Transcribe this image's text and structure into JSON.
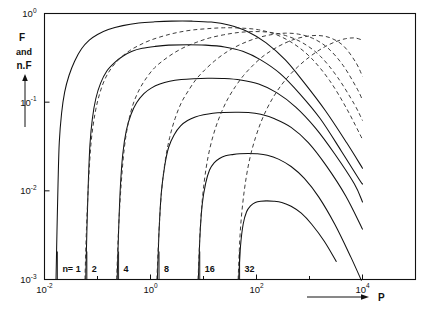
{
  "chart_data": {
    "type": "line",
    "title": "",
    "xlabel": "P",
    "ylabel": "F and n.F",
    "xscale": "log",
    "yscale": "log",
    "xlim": [
      0.01,
      100000.0
    ],
    "ylim": [
      0.001,
      1.0
    ],
    "grid": false,
    "legend": "none",
    "x_tick_labels": [
      "10",
      "10",
      "10",
      "10"
    ],
    "x_tick_exponents": [
      "-2",
      "0",
      "2",
      "4"
    ],
    "x_tick_values": [
      0.01,
      1.0,
      100.0,
      10000.0
    ],
    "x_minor_tick_values": [
      0.1,
      10.0,
      1000.0
    ],
    "y_tick_labels": [
      "10",
      "10",
      "10",
      "10"
    ],
    "y_tick_exponents": [
      "0",
      "-1",
      "-2",
      "-3"
    ],
    "y_tick_values": [
      1.0,
      0.1,
      0.01,
      0.001
    ],
    "n_prefix_label": "n=",
    "n_labels": [
      "1",
      "2",
      "4",
      "8",
      "16",
      "32"
    ],
    "n_values": [
      1,
      2,
      4,
      8,
      16,
      32
    ],
    "n_onset_P": [
      0.0175,
      0.063,
      0.25,
      1.45,
      8.5,
      48.0
    ],
    "series": [
      {
        "name": "n=1",
        "style": "solid",
        "peak_P": 8.0,
        "peak_F": 0.82,
        "onset_P": 0.0175,
        "points": [
          [
            0.0165,
            0.001
          ],
          [
            0.0172,
            0.0035
          ],
          [
            0.018,
            0.012
          ],
          [
            0.019,
            0.035
          ],
          [
            0.021,
            0.075
          ],
          [
            0.024,
            0.13
          ],
          [
            0.029,
            0.2
          ],
          [
            0.037,
            0.29
          ],
          [
            0.05,
            0.4
          ],
          [
            0.07,
            0.5
          ],
          [
            0.1,
            0.58
          ],
          [
            0.16,
            0.66
          ],
          [
            0.3,
            0.73
          ],
          [
            0.6,
            0.78
          ],
          [
            1.2,
            0.805
          ],
          [
            2.5,
            0.82
          ],
          [
            6.0,
            0.82
          ],
          [
            14.0,
            0.8
          ],
          [
            30.0,
            0.74
          ],
          [
            70.0,
            0.62
          ],
          [
            150.0,
            0.47
          ],
          [
            350.0,
            0.3
          ],
          [
            800.0,
            0.165
          ],
          [
            2000.0,
            0.08
          ],
          [
            5000.0,
            0.035
          ],
          [
            10000.0,
            0.018
          ]
        ]
      },
      {
        "name": "n=2",
        "style": "solid",
        "peak_P": 20.0,
        "peak_F": 0.44,
        "onset_P": 0.063,
        "points": [
          [
            0.06,
            0.001
          ],
          [
            0.063,
            0.0035
          ],
          [
            0.067,
            0.012
          ],
          [
            0.072,
            0.033
          ],
          [
            0.08,
            0.065
          ],
          [
            0.093,
            0.11
          ],
          [
            0.115,
            0.165
          ],
          [
            0.15,
            0.225
          ],
          [
            0.21,
            0.28
          ],
          [
            0.3,
            0.33
          ],
          [
            0.45,
            0.375
          ],
          [
            0.7,
            0.405
          ],
          [
            1.2,
            0.425
          ],
          [
            2.2,
            0.44
          ],
          [
            5.0,
            0.445
          ],
          [
            11.0,
            0.44
          ],
          [
            25.0,
            0.42
          ],
          [
            55.0,
            0.375
          ],
          [
            120.0,
            0.3
          ],
          [
            280.0,
            0.21
          ],
          [
            650.0,
            0.125
          ],
          [
            1600.0,
            0.065
          ],
          [
            4000.0,
            0.028
          ],
          [
            9000.0,
            0.013
          ],
          [
            10000.0,
            0.012
          ]
        ]
      },
      {
        "name": "n=4",
        "style": "solid",
        "peak_P": 40.0,
        "peak_F": 0.185,
        "onset_P": 0.25,
        "points": [
          [
            0.235,
            0.001
          ],
          [
            0.25,
            0.0035
          ],
          [
            0.27,
            0.011
          ],
          [
            0.3,
            0.026
          ],
          [
            0.35,
            0.048
          ],
          [
            0.43,
            0.073
          ],
          [
            0.55,
            0.099
          ],
          [
            0.75,
            0.125
          ],
          [
            1.05,
            0.145
          ],
          [
            1.5,
            0.16
          ],
          [
            2.3,
            0.172
          ],
          [
            3.8,
            0.18
          ],
          [
            6.5,
            0.184
          ],
          [
            12.0,
            0.186
          ],
          [
            25.0,
            0.185
          ],
          [
            50.0,
            0.178
          ],
          [
            110.0,
            0.16
          ],
          [
            240.0,
            0.128
          ],
          [
            550.0,
            0.088
          ],
          [
            1300.0,
            0.051
          ],
          [
            3000.0,
            0.026
          ],
          [
            7000.0,
            0.012
          ],
          [
            10000.0,
            0.0075
          ]
        ]
      },
      {
        "name": "n=8",
        "style": "solid",
        "peak_P": 75.0,
        "peak_F": 0.077,
        "onset_P": 1.45,
        "points": [
          [
            1.35,
            0.001
          ],
          [
            1.45,
            0.0035
          ],
          [
            1.6,
            0.0095
          ],
          [
            1.85,
            0.019
          ],
          [
            2.2,
            0.031
          ],
          [
            2.8,
            0.043
          ],
          [
            3.7,
            0.054
          ],
          [
            5.0,
            0.062
          ],
          [
            7.0,
            0.068
          ],
          [
            10.0,
            0.072
          ],
          [
            15.0,
            0.075
          ],
          [
            24.0,
            0.0765
          ],
          [
            40.0,
            0.077
          ],
          [
            70.0,
            0.0765
          ],
          [
            120.0,
            0.073
          ],
          [
            220.0,
            0.065
          ],
          [
            450.0,
            0.052
          ],
          [
            950.0,
            0.035
          ],
          [
            2100.0,
            0.019
          ],
          [
            4800.0,
            0.0088
          ],
          [
            10000.0,
            0.0037
          ]
        ]
      },
      {
        "name": "n=16",
        "style": "solid",
        "peak_P": 140.0,
        "peak_F": 0.026,
        "onset_P": 8.5,
        "points": [
          [
            8.0,
            0.001
          ],
          [
            8.6,
            0.0032
          ],
          [
            9.5,
            0.0072
          ],
          [
            11.0,
            0.0122
          ],
          [
            13.0,
            0.0172
          ],
          [
            16.0,
            0.0208
          ],
          [
            20.0,
            0.0232
          ],
          [
            26.0,
            0.0248
          ],
          [
            35.0,
            0.0256
          ],
          [
            48.0,
            0.0262
          ],
          [
            70.0,
            0.0264
          ],
          [
            100.0,
            0.0262
          ],
          [
            160.0,
            0.0252
          ],
          [
            260.0,
            0.0228
          ],
          [
            450.0,
            0.0188
          ],
          [
            800.0,
            0.0138
          ],
          [
            1500.0,
            0.0085
          ],
          [
            3000.0,
            0.0042
          ],
          [
            6000.0,
            0.0018
          ],
          [
            9500.0,
            0.00098
          ]
        ]
      },
      {
        "name": "n=32",
        "style": "solid",
        "peak_P": 280.0,
        "peak_F": 0.0077,
        "onset_P": 48.0,
        "points": [
          [
            46.0,
            0.001
          ],
          [
            50.0,
            0.0024
          ],
          [
            56.0,
            0.0042
          ],
          [
            65.0,
            0.0058
          ],
          [
            78.0,
            0.0068
          ],
          [
            95.0,
            0.0074
          ],
          [
            120.0,
            0.00765
          ],
          [
            155.0,
            0.0077
          ],
          [
            210.0,
            0.00765
          ],
          [
            300.0,
            0.0074
          ],
          [
            450.0,
            0.0067
          ],
          [
            700.0,
            0.0056
          ],
          [
            1100.0,
            0.0042
          ],
          [
            1900.0,
            0.0027
          ],
          [
            3200.0,
            0.0016
          ],
          [
            5200.0,
            0.00088
          ],
          [
            7000.0,
            0.00057
          ]
        ]
      },
      {
        "name": "nF-1",
        "style": "dashed",
        "peak_P": 30.0,
        "peak_F": 0.69,
        "onset_P": 0.062,
        "points": [
          [
            0.058,
            0.001
          ],
          [
            0.062,
            0.0038
          ],
          [
            0.068,
            0.013
          ],
          [
            0.076,
            0.036
          ],
          [
            0.09,
            0.075
          ],
          [
            0.11,
            0.125
          ],
          [
            0.14,
            0.185
          ],
          [
            0.19,
            0.25
          ],
          [
            0.27,
            0.315
          ],
          [
            0.4,
            0.38
          ],
          [
            0.62,
            0.44
          ],
          [
            1.0,
            0.5
          ],
          [
            1.8,
            0.56
          ],
          [
            3.2,
            0.61
          ],
          [
            6.0,
            0.65
          ],
          [
            12.0,
            0.675
          ],
          [
            24.0,
            0.69
          ],
          [
            50.0,
            0.685
          ],
          [
            110.0,
            0.655
          ],
          [
            240.0,
            0.575
          ],
          [
            520.0,
            0.45
          ],
          [
            1100.0,
            0.31
          ],
          [
            2400.0,
            0.175
          ],
          [
            5000.0,
            0.085
          ],
          [
            10000.0,
            0.038
          ]
        ]
      },
      {
        "name": "nF-2",
        "style": "dashed",
        "peak_P": 55.0,
        "peak_F": 0.625,
        "onset_P": 0.245,
        "points": [
          [
            0.23,
            0.001
          ],
          [
            0.25,
            0.0038
          ],
          [
            0.28,
            0.012
          ],
          [
            0.32,
            0.03
          ],
          [
            0.38,
            0.058
          ],
          [
            0.47,
            0.095
          ],
          [
            0.62,
            0.14
          ],
          [
            0.85,
            0.19
          ],
          [
            1.2,
            0.245
          ],
          [
            1.8,
            0.3
          ],
          [
            2.8,
            0.36
          ],
          [
            4.5,
            0.42
          ],
          [
            7.5,
            0.475
          ],
          [
            13.0,
            0.53
          ],
          [
            24.0,
            0.575
          ],
          [
            45.0,
            0.61
          ],
          [
            85.0,
            0.625
          ],
          [
            170.0,
            0.615
          ],
          [
            350.0,
            0.565
          ],
          [
            750.0,
            0.465
          ],
          [
            1600.0,
            0.33
          ],
          [
            3400.0,
            0.19
          ],
          [
            7000.0,
            0.095
          ],
          [
            10000.0,
            0.062
          ]
        ]
      },
      {
        "name": "nF-3",
        "style": "dashed",
        "peak_P": 110.0,
        "peak_F": 0.6,
        "onset_P": 1.42,
        "points": [
          [
            1.32,
            0.001
          ],
          [
            1.45,
            0.0036
          ],
          [
            1.62,
            0.01
          ],
          [
            1.9,
            0.022
          ],
          [
            2.3,
            0.04
          ],
          [
            2.9,
            0.065
          ],
          [
            3.8,
            0.098
          ],
          [
            5.2,
            0.135
          ],
          [
            7.2,
            0.18
          ],
          [
            10.5,
            0.23
          ],
          [
            16.0,
            0.29
          ],
          [
            25.0,
            0.355
          ],
          [
            40.0,
            0.42
          ],
          [
            68.0,
            0.485
          ],
          [
            115.0,
            0.54
          ],
          [
            200.0,
            0.58
          ],
          [
            350.0,
            0.6
          ],
          [
            620.0,
            0.585
          ],
          [
            1150.0,
            0.525
          ],
          [
            2200.0,
            0.41
          ],
          [
            4300.0,
            0.26
          ],
          [
            8000.0,
            0.14
          ],
          [
            10000.0,
            0.105
          ]
        ]
      },
      {
        "name": "nF-4",
        "style": "dashed",
        "peak_P": 220.0,
        "peak_F": 0.57,
        "onset_P": 8.4,
        "points": [
          [
            7.9,
            0.001
          ],
          [
            8.6,
            0.0034
          ],
          [
            9.6,
            0.0085
          ],
          [
            11.2,
            0.018
          ],
          [
            13.5,
            0.032
          ],
          [
            17.0,
            0.052
          ],
          [
            22.0,
            0.078
          ],
          [
            29.0,
            0.11
          ],
          [
            40.0,
            0.15
          ],
          [
            57.0,
            0.2
          ],
          [
            83.0,
            0.255
          ],
          [
            125.0,
            0.32
          ],
          [
            195.0,
            0.385
          ],
          [
            310.0,
            0.45
          ],
          [
            510.0,
            0.51
          ],
          [
            850.0,
            0.55
          ],
          [
            1450.0,
            0.565
          ],
          [
            2500.0,
            0.53
          ],
          [
            4400.0,
            0.43
          ],
          [
            7500.0,
            0.28
          ],
          [
            10000.0,
            0.195
          ]
        ]
      },
      {
        "name": "nF-5",
        "style": "dashed",
        "peak_P": 420.0,
        "peak_F": 0.54,
        "onset_P": 47.0,
        "points": [
          [
            45.0,
            0.001
          ],
          [
            49.0,
            0.0032
          ],
          [
            55.0,
            0.0072
          ],
          [
            64.0,
            0.0142
          ],
          [
            77.0,
            0.025
          ],
          [
            96.0,
            0.04
          ],
          [
            122.0,
            0.06
          ],
          [
            160.0,
            0.086
          ],
          [
            215.0,
            0.118
          ],
          [
            295.0,
            0.156
          ],
          [
            415.0,
            0.2
          ],
          [
            600.0,
            0.25
          ],
          [
            880.0,
            0.305
          ],
          [
            1320.0,
            0.365
          ],
          [
            2000.0,
            0.425
          ],
          [
            3100.0,
            0.48
          ],
          [
            4800.0,
            0.52
          ],
          [
            7200.0,
            0.53
          ],
          [
            10000.0,
            0.5
          ]
        ]
      }
    ]
  },
  "axes": {
    "y_axis_label_lines": [
      "F",
      "and",
      "n.F"
    ],
    "x_axis_label": "P",
    "y_arrow": "up-arrow",
    "x_arrow": "right-arrow"
  }
}
